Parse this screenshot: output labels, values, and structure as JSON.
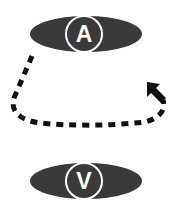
{
  "diagram": {
    "top_node": {
      "label": "A",
      "fill": "#3a3a3a",
      "ring": "#ffffff"
    },
    "bottom_node": {
      "label": "V",
      "fill": "#3a3a3a",
      "ring": "#ffffff"
    },
    "connector": {
      "style": "dashed",
      "color": "#111111",
      "direction": "arrow-up-left"
    }
  }
}
